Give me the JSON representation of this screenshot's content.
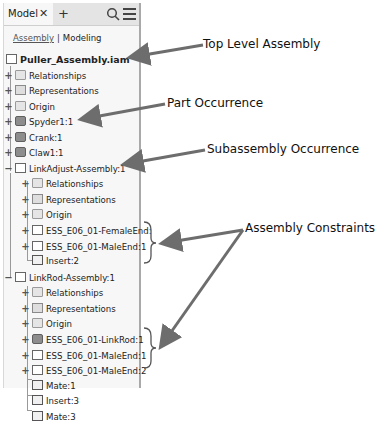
{
  "panel": {
    "tab_label": "Model",
    "close_icon": "close-icon",
    "add_icon": "plus-icon",
    "search_icon": "search-icon",
    "menu_icon": "hamburger-menu-icon",
    "subtabs": {
      "assembly": "Assembly",
      "separator": "|",
      "modeling": "Modeling"
    }
  },
  "tree": [
    {
      "label": "Puller_Assembly.iam",
      "level": 0,
      "icon": "assembly-icon",
      "expander": "",
      "bold": true
    },
    {
      "label": "Relationships",
      "level": 0,
      "icon": "folder-icon",
      "expander": "+"
    },
    {
      "label": "Representations",
      "level": 0,
      "icon": "representations-icon",
      "expander": "+"
    },
    {
      "label": "Origin",
      "level": 0,
      "icon": "folder-icon",
      "expander": "+"
    },
    {
      "label": "Spyder1:1",
      "level": 0,
      "icon": "part-adaptive-icon",
      "expander": "+"
    },
    {
      "label": "Crank:1",
      "level": 0,
      "icon": "part-icon",
      "expander": "+"
    },
    {
      "label": "Claw1:1",
      "level": 0,
      "icon": "part-icon",
      "expander": "+"
    },
    {
      "label": "LinkAdjust-Assembly:1",
      "level": 0,
      "icon": "assembly-icon",
      "expander": "−"
    },
    {
      "label": "Relationships",
      "level": 1,
      "icon": "folder-icon",
      "expander": "+"
    },
    {
      "label": "Representations",
      "level": 1,
      "icon": "representations-icon",
      "expander": "+"
    },
    {
      "label": "Origin",
      "level": 1,
      "icon": "folder-icon",
      "expander": "+"
    },
    {
      "label": "ESS_E06_01-FemaleEnd:",
      "level": 1,
      "icon": "assembly-adaptive-icon",
      "expander": "+"
    },
    {
      "label": "ESS_E06_01-MaleEnd:1",
      "level": 1,
      "icon": "assembly-icon",
      "expander": "+"
    },
    {
      "label": "Insert:2",
      "level": 1,
      "icon": "insert-constraint-icon",
      "expander": ""
    },
    {
      "label": "LinkRod-Assembly:1",
      "level": 0,
      "icon": "assembly-icon",
      "expander": "−"
    },
    {
      "label": "Relationships",
      "level": 1,
      "icon": "folder-icon",
      "expander": "+"
    },
    {
      "label": "Representations",
      "level": 1,
      "icon": "representations-icon",
      "expander": "+"
    },
    {
      "label": "Origin",
      "level": 1,
      "icon": "folder-icon",
      "expander": "+"
    },
    {
      "label": "ESS_E06_01-LinkRod:1",
      "level": 1,
      "icon": "part-adaptive-icon",
      "expander": "+"
    },
    {
      "label": "ESS_E06_01-MaleEnd:1",
      "level": 1,
      "icon": "assembly-icon",
      "expander": "+"
    },
    {
      "label": "ESS_E06_01-MaleEnd:2",
      "level": 1,
      "icon": "assembly-icon",
      "expander": "+"
    },
    {
      "label": "Mate:1",
      "level": 1,
      "icon": "mate-constraint-icon",
      "expander": ""
    },
    {
      "label": "Insert:3",
      "level": 1,
      "icon": "insert-constraint-icon",
      "expander": ""
    },
    {
      "label": "Mate:3",
      "level": 1,
      "icon": "mate-constraint-icon",
      "expander": ""
    }
  ],
  "callouts": {
    "top_level": "Top Level Assembly",
    "part": "Part Occurrence",
    "subassembly": "Subassembly Occurrence",
    "constraints": "Assembly Constraints"
  },
  "colors": {
    "arrow": "#6d6d6d",
    "panel_border": "#a9a9a9",
    "panel_bg": "#f7f7f7"
  }
}
